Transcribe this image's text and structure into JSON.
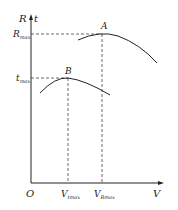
{
  "diagram": {
    "y_axis_label_left": "R",
    "y_axis_label_right": "t",
    "x_axis_label": "V",
    "origin_label": "O",
    "y_ticks": [
      {
        "main": "R",
        "sub": "max"
      },
      {
        "main": "t",
        "sub": "max"
      }
    ],
    "x_ticks": [
      {
        "main": "V",
        "sub": "tmax"
      },
      {
        "main": "V",
        "sub": "Rmax"
      }
    ],
    "points": [
      {
        "label": "A",
        "curve": "R(V)",
        "peak": "R_max at V_Rmax"
      },
      {
        "label": "B",
        "curve": "t(V)",
        "peak": "t_max at V_tmax"
      }
    ],
    "colors": {
      "line": "#222222",
      "dash": "#444444"
    }
  }
}
